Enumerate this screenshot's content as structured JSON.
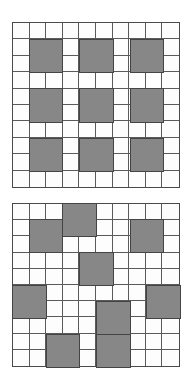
{
  "colors": {
    "cell_fill": "#fdfdfd",
    "block_fill": "#878787",
    "grid_line": "#5a5a5a",
    "block_border": "#444444",
    "background": "#ffffff"
  },
  "grids": [
    {
      "id": "top-grid",
      "rows": 10,
      "cols": 10,
      "x": 12,
      "y": 22,
      "width": 168,
      "height": 166,
      "blocks": [
        {
          "row": 1,
          "col": 1,
          "h": 2,
          "w": 2
        },
        {
          "row": 1,
          "col": 4,
          "h": 2,
          "w": 2
        },
        {
          "row": 1,
          "col": 7,
          "h": 2,
          "w": 2
        },
        {
          "row": 4,
          "col": 1,
          "h": 2,
          "w": 2
        },
        {
          "row": 4,
          "col": 4,
          "h": 2,
          "w": 2
        },
        {
          "row": 4,
          "col": 7,
          "h": 2,
          "w": 2
        },
        {
          "row": 7,
          "col": 1,
          "h": 2,
          "w": 2
        },
        {
          "row": 7,
          "col": 4,
          "h": 2,
          "w": 2
        },
        {
          "row": 7,
          "col": 7,
          "h": 2,
          "w": 2
        }
      ]
    },
    {
      "id": "bottom-grid",
      "rows": 10,
      "cols": 10,
      "x": 12,
      "y": 203,
      "width": 168,
      "height": 164,
      "blocks": [
        {
          "row": 0,
          "col": 3,
          "h": 2,
          "w": 2
        },
        {
          "row": 1,
          "col": 1,
          "h": 2,
          "w": 2
        },
        {
          "row": 1,
          "col": 7,
          "h": 2,
          "w": 2
        },
        {
          "row": 3,
          "col": 4,
          "h": 2,
          "w": 2
        },
        {
          "row": 5,
          "col": 0,
          "h": 2,
          "w": 2
        },
        {
          "row": 5,
          "col": 8,
          "h": 2,
          "w": 2
        },
        {
          "row": 6,
          "col": 5,
          "h": 2,
          "w": 2
        },
        {
          "row": 8,
          "col": 2,
          "h": 2,
          "w": 2
        },
        {
          "row": 8,
          "col": 5,
          "h": 2,
          "w": 2
        }
      ]
    }
  ]
}
